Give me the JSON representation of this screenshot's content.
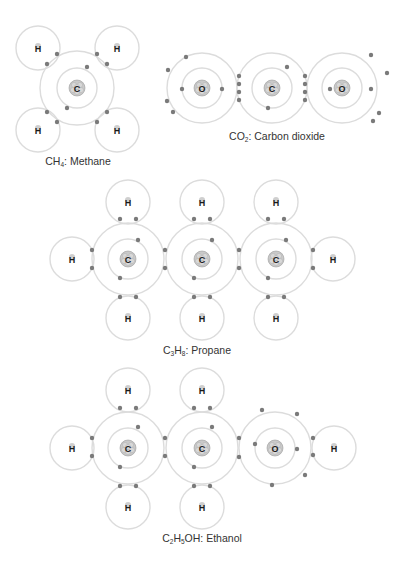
{
  "colors": {
    "shell": "#dcdcdc",
    "electron": "#7a7a7a",
    "nucleus_fill": "#c9c9c9",
    "nucleus_stroke": "#9a9a9a",
    "label": "#1a1a1a",
    "caption": "#333333"
  },
  "molecules": [
    {
      "id": "methane",
      "formula_parts": [
        [
          "C",
          ""
        ],
        [
          "H",
          "4"
        ]
      ],
      "name": "Methane",
      "caption_pos": [
        78,
        156
      ],
      "atoms": [
        {
          "el": "C",
          "x": 77,
          "y": 88,
          "r": 37,
          "inner": 20,
          "heavy": true
        },
        {
          "el": "H",
          "x": 38,
          "y": 48,
          "r": 22
        },
        {
          "el": "H",
          "x": 117,
          "y": 48,
          "r": 22
        },
        {
          "el": "H",
          "x": 38,
          "y": 130,
          "r": 22
        },
        {
          "el": "H",
          "x": 117,
          "y": 130,
          "r": 22
        }
      ],
      "electrons": [
        [
          47,
          64
        ],
        [
          57,
          54
        ],
        [
          97,
          54
        ],
        [
          107,
          64
        ],
        [
          47,
          112
        ],
        [
          57,
          122
        ],
        [
          97,
          122
        ],
        [
          107,
          112
        ],
        [
          87,
          67
        ],
        [
          67,
          108
        ]
      ]
    },
    {
      "id": "co2",
      "formula_parts": [
        [
          "CO",
          ""
        ],
        [
          "",
          "2"
        ]
      ],
      "name": "Carbon dioxide",
      "caption_pos": [
        277,
        131
      ],
      "atoms": [
        {
          "el": "O",
          "x": 202,
          "y": 88,
          "r": 35,
          "inner": 20,
          "heavy": true
        },
        {
          "el": "C",
          "x": 272,
          "y": 88,
          "r": 35,
          "inner": 20,
          "heavy": true
        },
        {
          "el": "O",
          "x": 342,
          "y": 88,
          "r": 35,
          "inner": 20,
          "heavy": true
        }
      ],
      "electrons": [
        [
          239,
          76
        ],
        [
          239,
          84
        ],
        [
          239,
          92
        ],
        [
          239,
          100
        ],
        [
          305,
          76
        ],
        [
          305,
          84
        ],
        [
          305,
          92
        ],
        [
          305,
          100
        ],
        [
          182,
          89
        ],
        [
          222,
          89
        ],
        [
          186,
          57
        ],
        [
          168,
          70
        ],
        [
          167,
          101
        ],
        [
          173,
          112
        ],
        [
          287,
          67
        ],
        [
          268,
          108
        ],
        [
          330,
          89
        ],
        [
          371,
          89
        ],
        [
          371,
          55
        ],
        [
          387,
          73
        ],
        [
          379,
          113
        ],
        [
          373,
          121
        ]
      ]
    },
    {
      "id": "propane",
      "formula_parts": [
        [
          "C",
          "3"
        ],
        [
          "H",
          "8"
        ]
      ],
      "name": "Propane",
      "caption_pos": [
        197,
        345
      ],
      "atoms": [
        {
          "el": "C",
          "x": 128,
          "y": 259,
          "r": 36,
          "inner": 20,
          "heavy": true
        },
        {
          "el": "C",
          "x": 202,
          "y": 259,
          "r": 36,
          "inner": 20,
          "heavy": true
        },
        {
          "el": "C",
          "x": 276,
          "y": 259,
          "r": 36,
          "inner": 20,
          "heavy": true
        },
        {
          "el": "H",
          "x": 128,
          "y": 202,
          "r": 22
        },
        {
          "el": "H",
          "x": 202,
          "y": 202,
          "r": 22
        },
        {
          "el": "H",
          "x": 276,
          "y": 202,
          "r": 22
        },
        {
          "el": "H",
          "x": 128,
          "y": 318,
          "r": 22
        },
        {
          "el": "H",
          "x": 202,
          "y": 318,
          "r": 22
        },
        {
          "el": "H",
          "x": 276,
          "y": 318,
          "r": 22
        },
        {
          "el": "H",
          "x": 72,
          "y": 259,
          "r": 22
        },
        {
          "el": "H",
          "x": 333,
          "y": 259,
          "r": 22
        }
      ],
      "electrons": [
        [
          120,
          219
        ],
        [
          136,
          219
        ],
        [
          194,
          219
        ],
        [
          210,
          219
        ],
        [
          268,
          219
        ],
        [
          284,
          219
        ],
        [
          120,
          297
        ],
        [
          136,
          297
        ],
        [
          194,
          297
        ],
        [
          210,
          297
        ],
        [
          268,
          297
        ],
        [
          284,
          297
        ],
        [
          92,
          250
        ],
        [
          92,
          268
        ],
        [
          165,
          250
        ],
        [
          165,
          268
        ],
        [
          239,
          250
        ],
        [
          239,
          268
        ],
        [
          313,
          250
        ],
        [
          313,
          268
        ],
        [
          138,
          240
        ],
        [
          120,
          278
        ],
        [
          212,
          240
        ],
        [
          194,
          278
        ],
        [
          286,
          240
        ],
        [
          268,
          278
        ]
      ]
    },
    {
      "id": "ethanol",
      "formula_parts": [
        [
          "C",
          "2"
        ],
        [
          "H",
          "5"
        ],
        [
          "OH",
          ""
        ]
      ],
      "name": "Ethanol",
      "caption_pos": [
        202,
        533
      ],
      "atoms": [
        {
          "el": "C",
          "x": 128,
          "y": 448,
          "r": 36,
          "inner": 20,
          "heavy": true
        },
        {
          "el": "C",
          "x": 202,
          "y": 448,
          "r": 36,
          "inner": 20,
          "heavy": true
        },
        {
          "el": "O",
          "x": 275,
          "y": 448,
          "r": 36,
          "inner": 20,
          "heavy": true
        },
        {
          "el": "H",
          "x": 128,
          "y": 390,
          "r": 22
        },
        {
          "el": "H",
          "x": 202,
          "y": 390,
          "r": 22
        },
        {
          "el": "H",
          "x": 128,
          "y": 507,
          "r": 22
        },
        {
          "el": "H",
          "x": 202,
          "y": 507,
          "r": 22
        },
        {
          "el": "H",
          "x": 72,
          "y": 448,
          "r": 22
        },
        {
          "el": "H",
          "x": 334,
          "y": 448,
          "r": 22
        }
      ],
      "electrons": [
        [
          120,
          408
        ],
        [
          136,
          408
        ],
        [
          194,
          408
        ],
        [
          210,
          408
        ],
        [
          120,
          486
        ],
        [
          136,
          486
        ],
        [
          194,
          486
        ],
        [
          210,
          486
        ],
        [
          92,
          438
        ],
        [
          92,
          456
        ],
        [
          165,
          438
        ],
        [
          165,
          456
        ],
        [
          239,
          438
        ],
        [
          239,
          457
        ],
        [
          313,
          438
        ],
        [
          313,
          455
        ],
        [
          138,
          427
        ],
        [
          120,
          467
        ],
        [
          212,
          427
        ],
        [
          194,
          467
        ],
        [
          262,
          410
        ],
        [
          297,
          414
        ],
        [
          255,
          444
        ],
        [
          297,
          449
        ],
        [
          305,
          475
        ],
        [
          272,
          485
        ]
      ]
    }
  ]
}
